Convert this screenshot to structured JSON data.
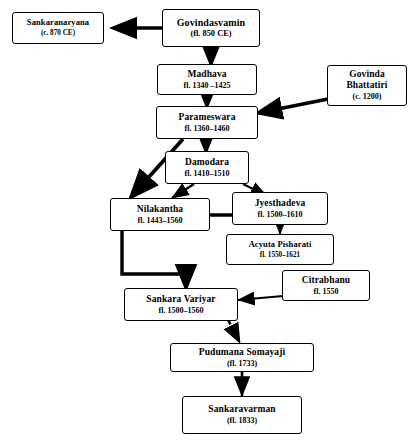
{
  "diagram": {
    "nodes": [
      {
        "id": "govindasvamin",
        "name": "Govindasvamin",
        "date": "(fl. 850 CE)"
      },
      {
        "id": "sankaranarayana",
        "name": "Sankaranaryana",
        "date": "(c. 870 CE)"
      },
      {
        "id": "madhava",
        "name": "Madhava",
        "date": "fl. 1340 –1425"
      },
      {
        "id": "govinda-bhattatiri",
        "name": "Govinda\nBhattatiri",
        "date": "(c. 1200)"
      },
      {
        "id": "govinda-bhattatiri-line1",
        "name": "Govinda",
        "date": ""
      },
      {
        "id": "parameswara",
        "name": "Parameswara",
        "date": "fl. 1360–1460"
      },
      {
        "id": "damodara",
        "name": "Damodara",
        "date": "fl. 1410–1510"
      },
      {
        "id": "nilakantha",
        "name": "Nilakantha",
        "date": "fl. 1443–1560"
      },
      {
        "id": "jyesthadeva",
        "name": "Jyesthadeva",
        "date": "fl. 1500–1610"
      },
      {
        "id": "acyuta-pisharati",
        "name": "Acyuta Pisharati",
        "date": "fl. 1550–1621"
      },
      {
        "id": "citrabhanu",
        "name": "Citrabhanu",
        "date": "fl. 1550"
      },
      {
        "id": "sankara-variyar",
        "name": "Sankara Variyar",
        "date": "fl. 1500–1560"
      },
      {
        "id": "pudumana-somayaji",
        "name": "Pudumana Somayaji",
        "date": "(fl. 1733)"
      },
      {
        "id": "sankaravarman",
        "name": "Sankaravarman",
        "date": "(fl. 1833)"
      }
    ],
    "bhattatiri": {
      "line1": "Govinda",
      "line2": "Bhattatiri",
      "date": "(c. 1200)"
    },
    "edges": [
      {
        "from": "govindasvamin",
        "to": "sankaranarayana",
        "style": "solid"
      },
      {
        "from": "govindasvamin",
        "to": "madhava",
        "style": "solid"
      },
      {
        "from": "madhava",
        "to": "parameswara",
        "style": "solid"
      },
      {
        "from": "govinda-bhattatiri",
        "to": "parameswara",
        "style": "solid"
      },
      {
        "from": "parameswara",
        "to": "damodara",
        "style": "solid"
      },
      {
        "from": "parameswara",
        "to": "nilakantha",
        "style": "solid"
      },
      {
        "from": "damodara",
        "to": "nilakantha",
        "style": "solid"
      },
      {
        "from": "damodara",
        "to": "jyesthadeva",
        "style": "solid"
      },
      {
        "from": "jyesthadeva",
        "to": "acyuta-pisharati",
        "style": "solid"
      },
      {
        "from": "jyesthadeva",
        "to": "sankara-variyar",
        "style": "solid"
      },
      {
        "from": "citrabhanu",
        "to": "sankara-variyar",
        "style": "solid"
      },
      {
        "from": "sankara-variyar",
        "to": "pudumana-somayaji",
        "style": "dashed"
      },
      {
        "from": "pudumana-somayaji",
        "to": "sankaravarman",
        "style": "solid"
      }
    ]
  }
}
